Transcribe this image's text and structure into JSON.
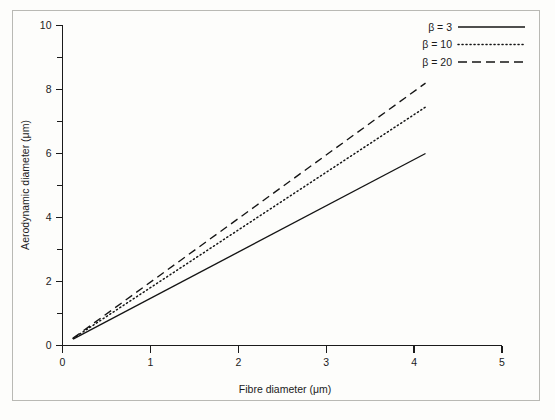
{
  "figure": {
    "background_color": "#fdfdfb",
    "frame_color": "#b9b9b4",
    "ink_color": "#141414"
  },
  "chart_data": {
    "type": "line",
    "title": "",
    "xlabel": "Fibre diameter (μm)",
    "ylabel": "Aerodynamic diameter (μm)",
    "xlim": [
      0,
      5
    ],
    "ylim": [
      0,
      10
    ],
    "xticks": [
      0,
      1,
      2,
      3,
      4,
      5
    ],
    "xticklabels": [
      "0",
      "1",
      "2",
      "3",
      "4",
      "5"
    ],
    "yticks": [
      0,
      2,
      4,
      6,
      8,
      10
    ],
    "yticklabels": [
      "0",
      "2",
      "4",
      "6",
      "8",
      "10"
    ],
    "y_minor_ticks": [
      1,
      3,
      5,
      7,
      9
    ],
    "grid": false,
    "legend_position": "upper right",
    "series": [
      {
        "name": "β = 3",
        "linestyle": "solid",
        "color": "#141414",
        "x": [
          0.12,
          4.13
        ],
        "y": [
          0.2,
          6.0
        ]
      },
      {
        "name": "β = 10",
        "linestyle": "dotted",
        "color": "#141414",
        "x": [
          0.12,
          4.13
        ],
        "y": [
          0.22,
          7.45
        ]
      },
      {
        "name": "β = 20",
        "linestyle": "dashed",
        "color": "#141414",
        "x": [
          0.12,
          4.13
        ],
        "y": [
          0.23,
          8.2
        ]
      }
    ]
  },
  "legend": {
    "entries": [
      {
        "label": "β = 3",
        "linestyle": "solid"
      },
      {
        "label": "β = 10",
        "linestyle": "dotted"
      },
      {
        "label": "β = 20",
        "linestyle": "dashed"
      }
    ]
  }
}
